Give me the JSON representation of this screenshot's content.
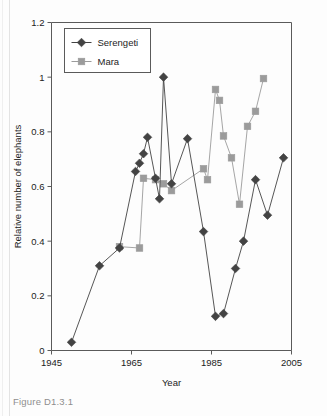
{
  "figure": {
    "caption": "Figure D1.3.1"
  },
  "chart_data": {
    "type": "line",
    "title": "",
    "xlabel": "Year",
    "ylabel": "Relative number of elephants",
    "xlim": [
      1945,
      2005
    ],
    "ylim": [
      0,
      1.2
    ],
    "xticks": [
      1945,
      1965,
      1985,
      2005
    ],
    "yticks": [
      0,
      0.2,
      0.4,
      0.6,
      0.8,
      1,
      1.2
    ],
    "xtick_labels": [
      "1945",
      "1965",
      "1985",
      "2005"
    ],
    "ytick_labels": [
      "0",
      "0.2",
      "0.4",
      "0.6",
      "0.8",
      "1",
      "1.2"
    ],
    "grid": false,
    "legend_position": "top-left-inside",
    "series": [
      {
        "name": "Serengeti",
        "color": "#434343",
        "marker": "diamond",
        "x": [
          1950,
          1957,
          1962,
          1966,
          1967,
          1968,
          1969,
          1971,
          1972,
          1973,
          1975,
          1979,
          1983,
          1986,
          1988,
          1991,
          1993,
          1996,
          1999,
          2003
        ],
        "y": [
          0.03,
          0.31,
          0.375,
          0.655,
          0.685,
          0.72,
          0.78,
          0.63,
          0.555,
          1.0,
          0.61,
          0.775,
          0.435,
          0.125,
          0.135,
          0.3,
          0.4,
          0.625,
          0.495,
          0.705
        ]
      },
      {
        "name": "Mara",
        "color": "#9b9b9b",
        "marker": "square",
        "x": [
          1962,
          1967,
          1968,
          1971,
          1973,
          1975,
          1983,
          1984,
          1986,
          1987,
          1988,
          1990,
          1992,
          1994,
          1996
        ],
        "y": [
          0.38,
          0.375,
          0.63,
          0.625,
          0.61,
          0.585,
          0.665,
          0.625,
          0.955,
          0.915,
          0.785,
          0.705,
          0.535,
          0.82,
          0.875
        ]
      }
    ],
    "series_extra_mara_last": {
      "x": 1998,
      "y": 0.995
    },
    "legend": [
      {
        "label": "Serengeti",
        "color": "#434343",
        "marker": "diamond"
      },
      {
        "label": "Mara",
        "color": "#9b9b9b",
        "marker": "square"
      }
    ]
  },
  "colors": {
    "serengeti": "#434343",
    "mara": "#9b9b9b",
    "axis": "#5a5a5a",
    "text": "#1c1c1c",
    "caption": "#8e8e8e",
    "background": "#fdfdfd"
  }
}
